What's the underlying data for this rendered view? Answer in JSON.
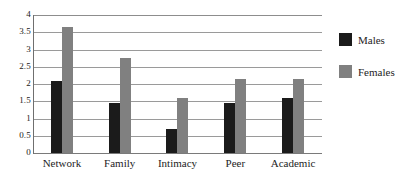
{
  "chart_data": {
    "type": "bar",
    "title": "",
    "xlabel": "",
    "ylabel": "",
    "ylim": [
      0,
      4
    ],
    "grid": true,
    "legend_position": "right",
    "categories": [
      "Network",
      "Family",
      "Intimacy",
      "Peer",
      "Academic"
    ],
    "yticks": [
      "0",
      "0.5",
      "1",
      "1.5",
      "2",
      "2.5",
      "3",
      "3.5",
      "4"
    ],
    "ytick_values": [
      0,
      0.5,
      1,
      1.5,
      2,
      2.5,
      3,
      3.5,
      4
    ],
    "series": [
      {
        "name": "Males",
        "color": "#1b1b1b",
        "values": [
          2.1,
          1.45,
          0.7,
          1.45,
          1.6
        ]
      },
      {
        "name": "Females",
        "color": "#808080",
        "values": [
          3.65,
          2.75,
          1.6,
          2.15,
          2.15
        ]
      }
    ]
  },
  "legend": {
    "items": [
      {
        "label": "Males",
        "color": "#1b1b1b"
      },
      {
        "label": "Females",
        "color": "#808080"
      }
    ]
  }
}
